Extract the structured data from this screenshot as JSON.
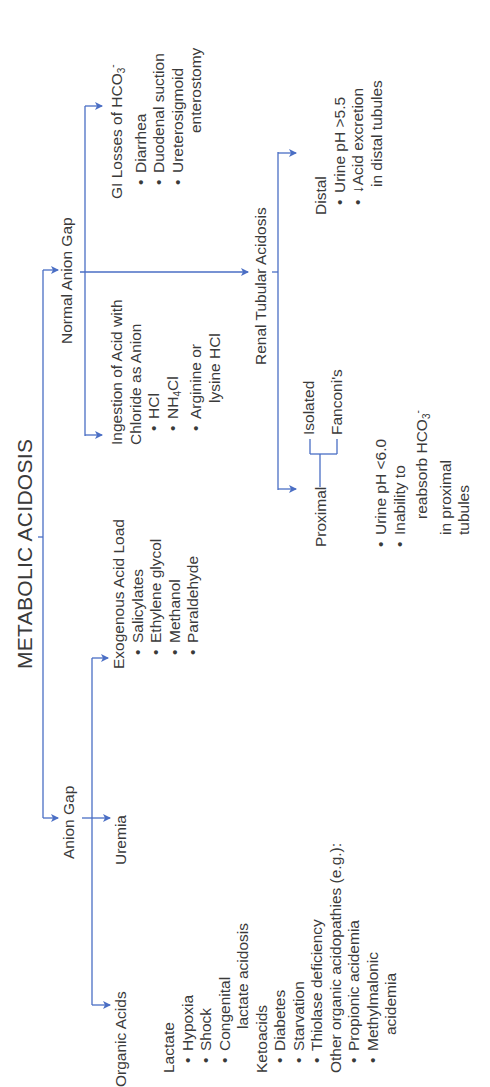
{
  "title": "METABOLIC ACIDOSIS",
  "colors": {
    "line": "#4a6ec4",
    "text": "#3a3a3a",
    "background": "#ffffff"
  },
  "anion_gap": {
    "label": "Anion Gap",
    "organic_acids": {
      "label": "Organic Acids",
      "lactate": {
        "label": "Lactate",
        "items": [
          "Hypoxia",
          "Shock",
          "Congenital"
        ],
        "continuation": "lactate acidosis"
      },
      "ketoacids": {
        "label": "Ketoacids",
        "items": [
          "Diabetes",
          "Starvation",
          "Thiolase deficiency"
        ]
      },
      "other": {
        "label": "Other organic acidopathies (e.g.):",
        "items": [
          "Propionic acidemia",
          "Methylmalonic"
        ],
        "continuation": "acidemia"
      }
    },
    "uremia": {
      "label": "Uremia"
    },
    "exogenous": {
      "label": "Exogenous Acid Load",
      "items": [
        "Salicylates",
        "Ethylene glycol",
        "Methanol",
        "Paraldehyde"
      ]
    }
  },
  "normal_anion_gap": {
    "label": "Normal Anion Gap",
    "ingestion": {
      "line1": "Ingestion of Acid with",
      "line2": "Chloride as Anion",
      "items": [
        "HCl",
        "NH",
        "Arginine or"
      ],
      "nh4_sub": "4",
      "nh4_tail": "Cl",
      "continuation": "lysine HCl"
    },
    "gi_losses": {
      "label": "GI Losses of HCO",
      "label_sub": "3",
      "label_sup": "-",
      "items": [
        "Diarrhea",
        "Duodenal suction",
        "Ureterosigmoid"
      ],
      "continuation": "enterostomy"
    },
    "rta": {
      "label": "Renal Tubular Acidosis",
      "proximal": {
        "label": "Proximal",
        "subtypes": [
          "Isolated",
          "Fanconi's"
        ],
        "items": [
          "Urine pH <6.0",
          "Inability to"
        ],
        "continuation": [
          "reabsorb HCO",
          "in proximal",
          "tubules"
        ],
        "hco3_sub": "3",
        "hco3_sup": "-"
      },
      "distal": {
        "label": "Distal",
        "items": [
          "Urine pH >5.5",
          "↓Acid excretion"
        ],
        "continuation": "in distal tubules"
      }
    }
  }
}
